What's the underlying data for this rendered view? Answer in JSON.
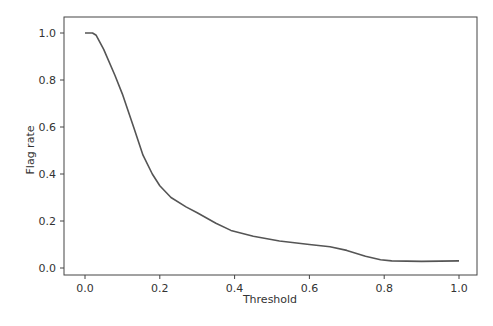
{
  "chart_data": {
    "type": "line",
    "title": "",
    "xlabel": "Threshold",
    "ylabel": "Flag rate",
    "xlim": [
      -0.05,
      1.05
    ],
    "ylim": [
      -0.05,
      1.05
    ],
    "xticks": [
      "0.0",
      "0.2",
      "0.4",
      "0.6",
      "0.8",
      "1.0"
    ],
    "yticks": [
      "0.0",
      "0.2",
      "0.4",
      "0.6",
      "0.8",
      "1.0"
    ],
    "grid": false,
    "legend": null,
    "series": [
      {
        "name": "Flag rate",
        "color": "#555555",
        "x": [
          0.0,
          0.02,
          0.03,
          0.05,
          0.08,
          0.1,
          0.13,
          0.155,
          0.18,
          0.2,
          0.23,
          0.27,
          0.3,
          0.35,
          0.39,
          0.45,
          0.52,
          0.6,
          0.655,
          0.7,
          0.75,
          0.79,
          0.82,
          0.9,
          1.0
        ],
        "values": [
          1.0,
          1.0,
          0.99,
          0.93,
          0.82,
          0.74,
          0.6,
          0.48,
          0.4,
          0.35,
          0.3,
          0.26,
          0.235,
          0.19,
          0.16,
          0.135,
          0.115,
          0.1,
          0.09,
          0.075,
          0.05,
          0.035,
          0.03,
          0.028,
          0.03
        ]
      }
    ]
  }
}
